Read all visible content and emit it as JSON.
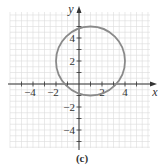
{
  "chart_data": {
    "type": "line",
    "title": "",
    "caption": "(c)",
    "xlabel": "x",
    "ylabel": "y",
    "xlim": [
      -6,
      6
    ],
    "ylim": [
      -6,
      6
    ],
    "x_ticks": [
      -4,
      -2,
      2,
      4
    ],
    "y_ticks": [
      -4,
      -2,
      2,
      4
    ],
    "grid": true,
    "series": [
      {
        "name": "circle",
        "shape": "circle",
        "center": [
          1,
          2
        ],
        "radius": 3,
        "equation": "(x-1)^2 + (y-2)^2 = 9",
        "color": "#8a8a8a"
      }
    ]
  },
  "colors": {
    "grid": "#dcdcdc",
    "axis": "#333333",
    "curve": "#8a8a8a"
  }
}
